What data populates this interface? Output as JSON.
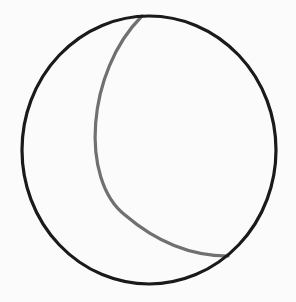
{
  "diagram": {
    "background_color": "#fbfbfb",
    "outer_circle": {
      "shape": "ellipse",
      "cx": 149,
      "cy": 150,
      "rx": 127,
      "ry": 134,
      "stroke_color": "#1a1a1a",
      "stroke_width": 3.2
    },
    "inner_arc": {
      "shape": "curve",
      "start": [
        142,
        16
      ],
      "end": [
        228,
        256
      ],
      "leftmost_point": [
        93,
        125
      ],
      "stroke_color": "#707070",
      "stroke_width": 3.2
    }
  }
}
